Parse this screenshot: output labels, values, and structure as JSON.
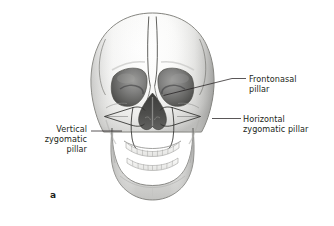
{
  "figure": {
    "letter": "a",
    "background_color": "#ffffff",
    "text_color": "#231f20",
    "leader_line_color": "#231f20"
  },
  "labels": {
    "frontonasal": {
      "name": "frontonasal-pillar",
      "lines": [
        "Frontonasal",
        "pillar"
      ],
      "side": "right"
    },
    "horizontal_zygomatic": {
      "name": "horizontal-zygomatic-pillar",
      "lines": [
        "Horizontal",
        "zygomatic pillar"
      ],
      "side": "right"
    },
    "vertical_zygomatic": {
      "name": "vertical-zygomatic-pillar",
      "lines": [
        "Vertical",
        "zygomatic",
        "pillar"
      ],
      "side": "left"
    }
  },
  "anatomy": {
    "palette": {
      "bone_light": "#fbfbfa",
      "bone_mid": "#e6e6e4",
      "bone_shadow": "#b9b9b7",
      "bone_deep_shadow": "#8e8e8c",
      "orbit_fill": "#7a7a78",
      "orbit_dark": "#565654",
      "nasal_cavity": "#4a4a48",
      "outline": "#4a4a48",
      "pillar_line": "#333331",
      "tooth": "#f4f4f2",
      "tooth_line": "#9a9a98"
    },
    "parts": [
      "cranium",
      "frontal-bone",
      "left-orbit",
      "right-orbit",
      "nasal-aperture",
      "nasal-septum",
      "zygomatic-arch-left",
      "zygomatic-arch-right",
      "maxilla",
      "mandible",
      "upper-teeth",
      "lower-teeth"
    ]
  }
}
